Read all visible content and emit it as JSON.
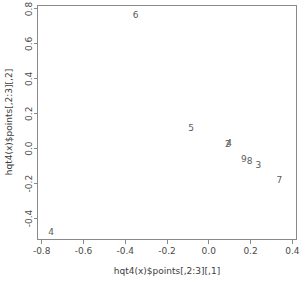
{
  "chart_data": {
    "type": "scatter",
    "title": "",
    "xlabel": "hqt4(x)$points[,2:3][,1]",
    "ylabel": "hqt4(x)$points[,2:3][,2]",
    "xlim": [
      -0.82,
      0.42
    ],
    "ylim": [
      -0.52,
      0.82
    ],
    "grid": false,
    "legend": "none",
    "marker_style": "text-labels",
    "xticks": [
      "-0.8",
      "-0.6",
      "-0.4",
      "-0.2",
      "0.0",
      "0.2",
      "0.4"
    ],
    "xtick_values": [
      -0.8,
      -0.6,
      -0.4,
      -0.2,
      0.0,
      0.2,
      0.4
    ],
    "yticks": [
      "-0.4",
      "-0.2",
      "0.0",
      "0.2",
      "0.4",
      "0.6",
      "0.8"
    ],
    "ytick_values": [
      -0.4,
      -0.2,
      0.0,
      0.2,
      0.4,
      0.6,
      0.8
    ],
    "points": [
      {
        "label": "6",
        "x": -0.35,
        "y": 0.765
      },
      {
        "label": "5",
        "x": -0.085,
        "y": 0.115
      },
      {
        "label": "2",
        "x": 0.092,
        "y": 0.022
      },
      {
        "label": "4",
        "x": 0.097,
        "y": 0.028
      },
      {
        "label": "9",
        "x": 0.168,
        "y": -0.063
      },
      {
        "label": "8",
        "x": 0.196,
        "y": -0.072
      },
      {
        "label": "3",
        "x": 0.238,
        "y": -0.098
      },
      {
        "label": "7",
        "x": 0.338,
        "y": -0.183
      },
      {
        "label": "4",
        "x": -0.755,
        "y": -0.478
      }
    ]
  },
  "axes": {
    "x_title": "hqt4(x)$points[,2:3][,1]",
    "y_title": "hqt4(x)$points[,2:3][,2]"
  },
  "colors": {
    "frame": "#8a8a8a",
    "text": "#4a4a4a",
    "point": "#5a5a5a",
    "background": "#ffffff"
  }
}
